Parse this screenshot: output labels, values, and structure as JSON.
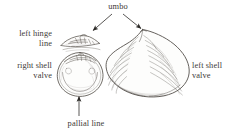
{
  "figure": {
    "background_color": "#ffffff",
    "ink_color": "#3d3a37",
    "shell_line_color": "#55504c",
    "shell_fill_color": "#fdfdfc"
  },
  "labels": {
    "umbo": "umbo",
    "left_hinge_line": "left hinge\nline",
    "right_shell_valve": "right shell\nvalve",
    "left_shell_valve": "left shell\nvalve",
    "pallial_line": "pallial line"
  },
  "annotations": {
    "umbo_arrow_left_target": "hinge line umbo",
    "umbo_arrow_right_target": "left shell valve umbo",
    "pallial_arrow_target": "pallial line on right shell valve interior"
  },
  "illustrations": {
    "hinge_line": "left hinge line structure, elongated wing shape",
    "right_valve": "right shell valve, interior view, rounded outline",
    "left_valve": "left shell valve, exterior view with concentric growth rings"
  }
}
